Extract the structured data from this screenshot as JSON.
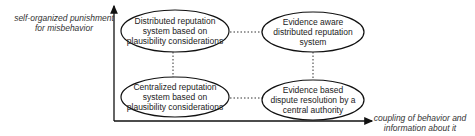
{
  "axes": {
    "y_label_line1": "self-organized punishment",
    "y_label_line2": "for misbehavior",
    "x_label_line1": "coupling of behavior and",
    "x_label_line2": "information about it"
  },
  "nodes": [
    {
      "line1": "Distributed reputation",
      "line2": "system based on",
      "line3": "plausibility considerations"
    },
    {
      "line1": "Evidence aware",
      "line2": "distributed reputation",
      "line3": "system"
    },
    {
      "line1": "Centralized reputation",
      "line2": "system based on",
      "line3": "plausibility considerations"
    },
    {
      "line1": "Evidence based",
      "line2": "dispute resolution by a",
      "line3": "central authority"
    }
  ]
}
